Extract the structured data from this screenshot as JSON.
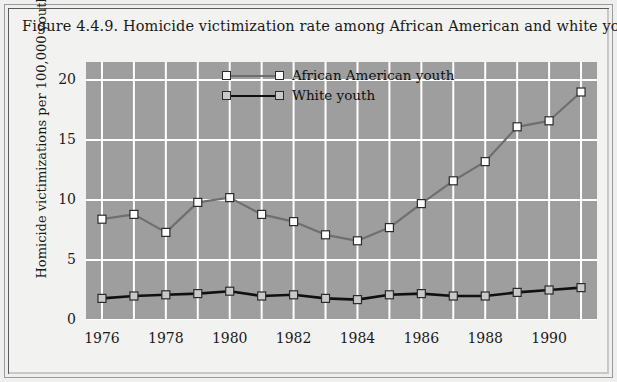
{
  "figure": {
    "title": "Figure 4.4.9. Homicide victimization rate among African American and white youth, 1976-1991."
  },
  "colors": {
    "plot_background": "#9e9e9e",
    "page_background": "#efefef",
    "gridline": "#ffffff",
    "african_american_line": "#6f6f6f",
    "african_american_marker_fill": "#ffffff",
    "white_line": "#101010",
    "white_marker_fill": "#c9c9c9",
    "marker_stroke": "#2b2b2b",
    "text": "#1a1a1a"
  },
  "legend": {
    "position": "top-center",
    "entries": [
      {
        "label": "African American youth",
        "line_color": "#6f6f6f",
        "marker_fill": "#ffffff"
      },
      {
        "label": "White youth",
        "line_color": "#101010",
        "marker_fill": "#c9c9c9"
      }
    ]
  },
  "axes": {
    "y_title": "Homicide victimizations per 100,000 youths",
    "y_ticks": [
      "0",
      "5",
      "10",
      "15",
      "20"
    ],
    "x_ticks": [
      "1976",
      "1978",
      "1980",
      "1982",
      "1984",
      "1986",
      "1988",
      "1990"
    ]
  },
  "chart_data": {
    "type": "line",
    "title": "Figure 4.4.9. Homicide victimization rate among African American and white youth, 1976-1991.",
    "xlabel": "",
    "ylabel": "Homicide victimizations per 100,000 youths",
    "xlim": [
      1975.5,
      1991.5
    ],
    "ylim": [
      0,
      21.5
    ],
    "yticks": [
      0,
      5,
      10,
      15,
      20
    ],
    "xticks": [
      1976,
      1978,
      1980,
      1982,
      1984,
      1986,
      1988,
      1990
    ],
    "grid": true,
    "legend_position": "top-center",
    "x": [
      1976,
      1977,
      1978,
      1979,
      1980,
      1981,
      1982,
      1983,
      1984,
      1985,
      1986,
      1987,
      1988,
      1989,
      1990,
      1991
    ],
    "series": [
      {
        "name": "African American youth",
        "color": "#6f6f6f",
        "marker": "square",
        "values": [
          8.4,
          8.8,
          7.3,
          9.8,
          10.2,
          8.8,
          8.2,
          7.1,
          6.6,
          7.7,
          9.7,
          11.6,
          13.2,
          16.1,
          16.6,
          19.0
        ]
      },
      {
        "name": "White youth",
        "color": "#101010",
        "marker": "square",
        "values": [
          1.8,
          2.0,
          2.1,
          2.2,
          2.4,
          2.0,
          2.1,
          1.8,
          1.7,
          2.1,
          2.2,
          2.0,
          2.0,
          2.3,
          2.5,
          2.7
        ]
      }
    ]
  }
}
